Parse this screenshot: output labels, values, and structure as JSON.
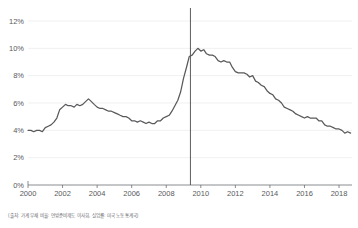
{
  "chart_data": {
    "type": "line",
    "title": "",
    "subtitle": "",
    "xlabel": "",
    "ylabel": "",
    "xlim": [
      2000,
      2018.75
    ],
    "ylim": [
      0,
      12
    ],
    "grid": true,
    "legend": "none",
    "y_tick_labels": [
      "0%",
      "2%",
      "4%",
      "6%",
      "8%",
      "10%",
      "12%"
    ],
    "y_ticks": [
      0,
      2,
      4,
      6,
      8,
      10,
      12
    ],
    "x_tick_labels": [
      "2000",
      "2002",
      "2004",
      "2006",
      "2008",
      "2010",
      "2012",
      "2014",
      "2016",
      "2018"
    ],
    "x_ticks": [
      2000,
      2002,
      2004,
      2006,
      2008,
      2010,
      2012,
      2014,
      2016,
      2018
    ],
    "annotations": [
      {
        "name": "recession-reference-line",
        "type": "vline",
        "x": 2009.4,
        "label": ""
      }
    ],
    "series": [
      {
        "name": "Unemployment rate",
        "color": "#58595b",
        "x": [
          2000.0,
          2000.17,
          2000.33,
          2000.5,
          2000.67,
          2000.83,
          2001.0,
          2001.17,
          2001.33,
          2001.5,
          2001.67,
          2001.83,
          2002.0,
          2002.17,
          2002.33,
          2002.5,
          2002.67,
          2002.83,
          2003.0,
          2003.17,
          2003.33,
          2003.5,
          2003.67,
          2003.83,
          2004.0,
          2004.17,
          2004.33,
          2004.5,
          2004.67,
          2004.83,
          2005.0,
          2005.17,
          2005.33,
          2005.5,
          2005.67,
          2005.83,
          2006.0,
          2006.17,
          2006.33,
          2006.5,
          2006.67,
          2006.83,
          2007.0,
          2007.17,
          2007.33,
          2007.5,
          2007.67,
          2007.83,
          2008.0,
          2008.17,
          2008.33,
          2008.5,
          2008.67,
          2008.83,
          2009.0,
          2009.17,
          2009.33,
          2009.5,
          2009.67,
          2009.83,
          2010.0,
          2010.17,
          2010.33,
          2010.5,
          2010.67,
          2010.83,
          2011.0,
          2011.17,
          2011.33,
          2011.5,
          2011.67,
          2011.83,
          2012.0,
          2012.17,
          2012.33,
          2012.5,
          2012.67,
          2012.83,
          2013.0,
          2013.17,
          2013.33,
          2013.5,
          2013.67,
          2013.83,
          2014.0,
          2014.17,
          2014.33,
          2014.5,
          2014.67,
          2014.83,
          2015.0,
          2015.17,
          2015.33,
          2015.5,
          2015.67,
          2015.83,
          2016.0,
          2016.17,
          2016.33,
          2016.5,
          2016.67,
          2016.83,
          2017.0,
          2017.17,
          2017.33,
          2017.5,
          2017.67,
          2017.83,
          2018.0,
          2018.17,
          2018.33,
          2018.5,
          2018.67
        ],
        "values": [
          4.0,
          4.0,
          3.9,
          4.0,
          4.0,
          3.9,
          4.2,
          4.3,
          4.4,
          4.6,
          4.9,
          5.5,
          5.7,
          5.9,
          5.8,
          5.8,
          5.7,
          5.9,
          5.8,
          5.9,
          6.1,
          6.3,
          6.1,
          5.9,
          5.7,
          5.6,
          5.6,
          5.5,
          5.4,
          5.4,
          5.3,
          5.2,
          5.1,
          5.0,
          5.0,
          4.9,
          4.7,
          4.7,
          4.6,
          4.7,
          4.6,
          4.5,
          4.6,
          4.5,
          4.5,
          4.7,
          4.7,
          4.9,
          5.0,
          5.1,
          5.4,
          5.8,
          6.2,
          6.8,
          7.8,
          8.6,
          9.4,
          9.5,
          9.8,
          10.0,
          9.8,
          9.9,
          9.6,
          9.5,
          9.5,
          9.4,
          9.1,
          9.0,
          9.1,
          9.0,
          9.0,
          8.6,
          8.3,
          8.2,
          8.2,
          8.2,
          8.1,
          7.9,
          8.0,
          7.6,
          7.5,
          7.3,
          7.2,
          6.9,
          6.7,
          6.6,
          6.3,
          6.2,
          6.0,
          5.7,
          5.6,
          5.5,
          5.4,
          5.2,
          5.1,
          5.0,
          4.9,
          5.0,
          4.9,
          4.9,
          4.9,
          4.7,
          4.7,
          4.4,
          4.3,
          4.3,
          4.2,
          4.1,
          4.1,
          4.0,
          3.8,
          3.9,
          3.8
        ]
      }
    ]
  },
  "footnote": {
    "source_text": "(출처: 가계 부채 비율: 연방준비제도 이사회, 실업률: 미국 노동통계국)"
  },
  "colors": {
    "line": "#58595b",
    "grid": "#e9e9ea",
    "axis": "#6d6e71",
    "reference_line": "#4a4a4a",
    "background": "#ffffff"
  }
}
